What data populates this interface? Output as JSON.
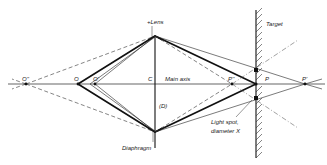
{
  "diagram": {
    "type": "optical ray diagram",
    "labels": {
      "lens": "+Lens",
      "target": "Target",
      "main_axis": "Main axis",
      "diaphragm": "Diaphragm",
      "diaphragm_symbol": "(D)",
      "light_spot_line1": "Light spot,",
      "light_spot_line2": "diameter X",
      "center": "C",
      "object_point": "O",
      "object_point_near": "O'",
      "object_point_far": "O''",
      "image_point": "P",
      "image_point_far": "P'",
      "image_point_near": "P''"
    },
    "points": {
      "O_double_prime": {
        "x": 26,
        "y": 84
      },
      "O": {
        "x": 78,
        "y": 84
      },
      "O_prime": {
        "x": 95,
        "y": 84
      },
      "C": {
        "x": 155,
        "y": 84
      },
      "lens_top": {
        "x": 155,
        "y": 36
      },
      "lens_bottom": {
        "x": 155,
        "y": 132
      },
      "P_double_prime": {
        "x": 232,
        "y": 84
      },
      "P": {
        "x": 256,
        "y": 84
      },
      "P_prime": {
        "x": 305,
        "y": 84
      },
      "spot_top": {
        "x": 256,
        "y": 70
      },
      "spot_bottom": {
        "x": 256,
        "y": 98
      }
    },
    "target_wall": {
      "x": 256,
      "y_top": 10,
      "y_bottom": 158
    }
  }
}
